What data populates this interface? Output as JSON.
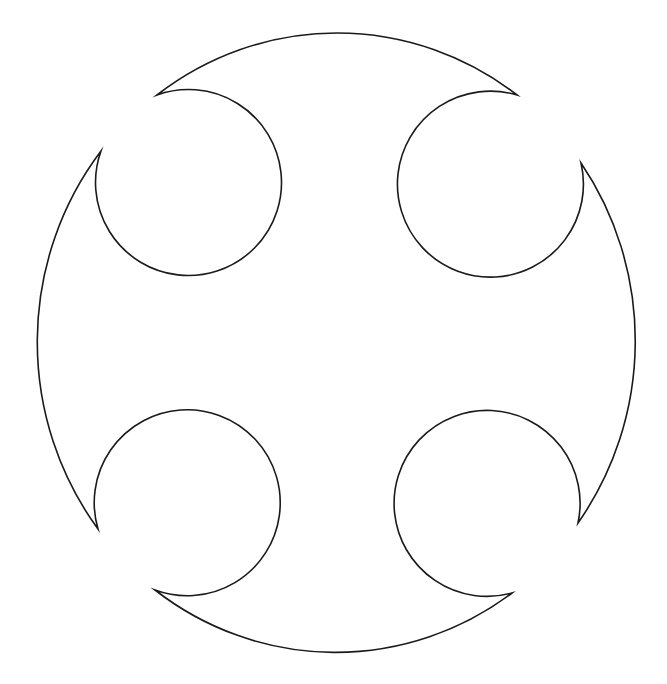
{
  "figure": {
    "background_color": "#ffffff",
    "stroke_color": "#1a1a1a",
    "fill_color": "#ffffff",
    "outer_circle": {
      "cx": 337,
      "cy": 343.5,
      "rx": 300,
      "ry": 310
    },
    "cutouts": [
      {
        "position": "top-left",
        "cx": 187,
        "cy": 185,
        "r": 93,
        "tips": [
          [
            101,
            151
          ],
          [
            157,
            95
          ]
        ]
      },
      {
        "position": "top-right",
        "cx": 493,
        "cy": 187,
        "r": 93,
        "tips": [
          [
            517,
            95
          ],
          [
            581,
            163
          ]
        ]
      },
      {
        "position": "bottom-right",
        "cx": 490,
        "cy": 501,
        "r": 93,
        "tips": [
          [
            578,
            523
          ],
          [
            512,
            593
          ]
        ]
      },
      {
        "position": "bottom-left",
        "cx": 186,
        "cy": 498,
        "r": 93,
        "tips": [
          [
            155,
            590
          ],
          [
            98,
            529
          ]
        ]
      }
    ],
    "path_d": "M157,95 A300,310 0 0 1 517,95 A93,93 0 1 0 581,163 A300,310 0 0 1 578,523 A93,93 0 1 0 512,593 A300,310 0 0 1 155,590 A93,93 0 1 0 98,529 A300,310 0 0 1 101,151 A93,93 0 1 0 157,95 Z"
  }
}
